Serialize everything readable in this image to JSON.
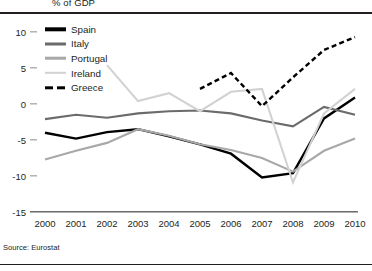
{
  "figure": {
    "unit_label": "% of GDP",
    "source": "Source: Eurostat"
  },
  "chart_data": {
    "type": "line",
    "title": "",
    "subtitle": "",
    "unit_label": "% of GDP",
    "xlabel": "",
    "ylabel": "",
    "categories": [
      "2000",
      "2001",
      "2002",
      "2003",
      "2004",
      "2005",
      "2006",
      "2007",
      "2008",
      "2009",
      "2010"
    ],
    "x": [
      2000,
      2001,
      2002,
      2003,
      2004,
      2005,
      2006,
      2007,
      2008,
      2009,
      2010
    ],
    "xlim": [
      2000,
      2010
    ],
    "ylim": [
      -15,
      10
    ],
    "yticks": [
      10,
      5,
      0,
      -5,
      -10,
      -15
    ],
    "ytick_labels": [
      "10",
      "5",
      "0",
      "-5",
      "-10",
      "-15"
    ],
    "grid": false,
    "legend_position": "top-left",
    "source": "Source: Eurostat",
    "series": [
      {
        "name": "Spain",
        "color": "#000000",
        "style": "solid",
        "width": 2.4,
        "values": [
          -4.0,
          -4.8,
          -3.9,
          -3.5,
          -4.5,
          -5.6,
          -6.9,
          -10.2,
          -9.6,
          -2.0,
          0.9
        ]
      },
      {
        "name": "Italy",
        "color": "#6b6b6b",
        "style": "solid",
        "width": 2.1,
        "values": [
          -2.1,
          -1.5,
          -1.9,
          -1.3,
          -1.0,
          -0.9,
          -1.3,
          -2.3,
          -3.1,
          -0.4,
          -1.5
        ]
      },
      {
        "name": "Portugal",
        "color": "#a8a8a8",
        "style": "solid",
        "width": 2.1,
        "values": [
          -7.7,
          -6.5,
          -5.4,
          -3.5,
          -4.4,
          -5.6,
          -6.4,
          -7.5,
          -9.4,
          -6.5,
          -4.8
        ]
      },
      {
        "name": "Ireland",
        "color": "#d2d2d2",
        "style": "solid",
        "width": 2.1,
        "values": [
          null,
          null,
          5.4,
          0.4,
          1.5,
          -1.0,
          1.7,
          2.1,
          -10.9,
          -1.3,
          2.1
        ]
      },
      {
        "name": "Greece",
        "color": "#000000",
        "style": "dashed",
        "width": 2.4,
        "values": [
          null,
          null,
          null,
          null,
          null,
          2.1,
          4.3,
          -0.3,
          3.7,
          7.5,
          9.3
        ]
      }
    ]
  },
  "legend": {
    "items": [
      {
        "label": "Spain",
        "color": "#000000",
        "style": "solid",
        "thickness": 3.4
      },
      {
        "label": "Italy",
        "color": "#6b6b6b",
        "style": "solid",
        "thickness": 3.0
      },
      {
        "label": "Portugal",
        "color": "#a8a8a8",
        "style": "solid",
        "thickness": 2.6
      },
      {
        "label": "Ireland",
        "color": "#d2d2d2",
        "style": "solid",
        "thickness": 2.4
      },
      {
        "label": "Greece",
        "color": "#000000",
        "style": "dashed",
        "thickness": 3.4
      }
    ]
  }
}
